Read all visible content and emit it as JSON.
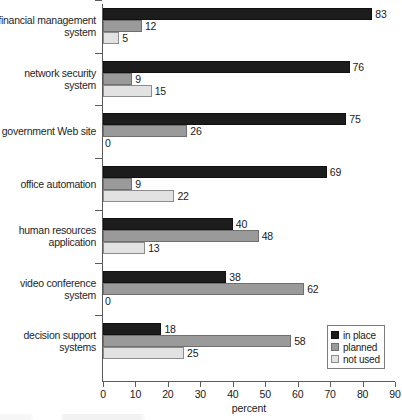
{
  "chart_data": {
    "type": "bar",
    "orientation": "horizontal",
    "title": "",
    "xlabel": "percent",
    "ylabel": "",
    "xlim": [
      0,
      90
    ],
    "xticks": [
      0,
      10,
      20,
      30,
      40,
      50,
      60,
      70,
      80,
      90
    ],
    "grid": false,
    "legend_position": "bottom-right",
    "categories": [
      "financial management system",
      "network security system",
      "government Web site",
      "office automation",
      "human resources application",
      "video conference system",
      "decision support systems"
    ],
    "category_lines": [
      [
        "financial management",
        "system"
      ],
      [
        "network security",
        "system"
      ],
      [
        "government Web site"
      ],
      [
        "office automation"
      ],
      [
        "human resources",
        "application"
      ],
      [
        "video conference",
        "system"
      ],
      [
        "decision support",
        "systems"
      ]
    ],
    "series": [
      {
        "name": "in place",
        "color": "#1c1c1c",
        "values": [
          83,
          76,
          75,
          69,
          40,
          38,
          18
        ]
      },
      {
        "name": "planned",
        "color": "#9a9a9a",
        "values": [
          12,
          9,
          26,
          9,
          48,
          62,
          58
        ]
      },
      {
        "name": "not used",
        "color": "#e2e2e2",
        "values": [
          5,
          15,
          0,
          22,
          13,
          0,
          25
        ]
      }
    ],
    "data_labels": [
      {
        "category": "financial management system",
        "in place": 83,
        "planned": 12,
        "not used": 5
      },
      {
        "category": "network security system",
        "in place": 76,
        "planned": 9,
        "not used": 15
      },
      {
        "category": "government Web site",
        "in place": 75,
        "planned": 26,
        "not used": 0
      },
      {
        "category": "office automation",
        "in place": 69,
        "planned": 9,
        "not used": 22
      },
      {
        "category": "human resources application",
        "in place": 40,
        "planned": 48,
        "not used": 13
      },
      {
        "category": "video conference system",
        "in place": 38,
        "planned": 62,
        "not used": 0
      },
      {
        "category": "decision support systems",
        "in place": 18,
        "planned": 58,
        "not used": 25
      }
    ]
  },
  "legend": {
    "entries": [
      {
        "label": "in place",
        "swatch": "black-swatch"
      },
      {
        "label": "planned",
        "swatch": "gray-swatch"
      },
      {
        "label": "not used",
        "swatch": "light-gray-swatch"
      }
    ]
  },
  "axis": {
    "x_title": "percent",
    "x_tick_labels": [
      "0",
      "10",
      "20",
      "30",
      "40",
      "50",
      "60",
      "70",
      "80",
      "90"
    ]
  }
}
